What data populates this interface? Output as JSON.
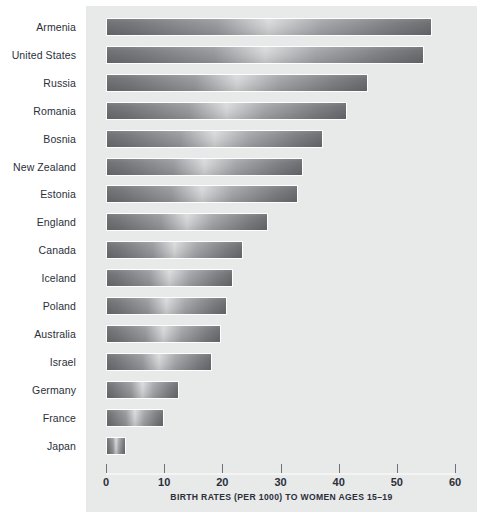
{
  "chart_data": {
    "type": "bar",
    "orientation": "horizontal",
    "title": "",
    "xlabel": "BIRTH RATES (PER 1000) TO WOMEN AGES 15–19",
    "ylabel": "",
    "xlim": [
      0,
      60
    ],
    "xticks": [
      0,
      10,
      20,
      30,
      40,
      50,
      60
    ],
    "xtick_labels": [
      "0",
      "10",
      "20",
      "30",
      "40",
      "50",
      "60"
    ],
    "grid": false,
    "legend": false,
    "categories": [
      "Armenia",
      "United States",
      "Russia",
      "Romania",
      "Bosnia",
      "New Zealand",
      "Estonia",
      "England",
      "Canada",
      "Iceland",
      "Poland",
      "Australia",
      "Israel",
      "Germany",
      "France",
      "Japan"
    ],
    "values": [
      56,
      54.6,
      45,
      41.5,
      37.3,
      33.8,
      33,
      27.8,
      23.5,
      21.8,
      20.8,
      19.8,
      18.2,
      12.5,
      10,
      3.4
    ],
    "bar_color": "#8b8c90",
    "panel_color": "#e8e9e9",
    "label_color": "#2b2f3a"
  },
  "caption": {
    "text": "BIRTH RATES (PER 1000) TO WOMEN AGES 15–19"
  }
}
